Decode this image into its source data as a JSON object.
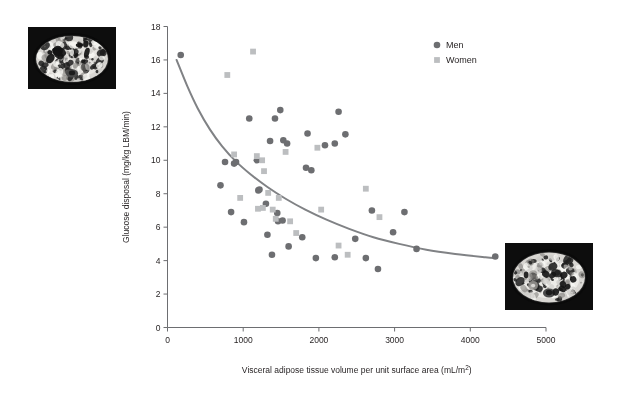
{
  "figure": {
    "background_color": "#ffffff",
    "width": 642,
    "height": 394
  },
  "images": [
    {
      "name": "mri-top-left",
      "caption": "",
      "description_icon": "abdominal-mri-scan"
    },
    {
      "name": "mri-bottom-right",
      "caption": "",
      "description_icon": "abdominal-mri-scan"
    }
  ],
  "chart_data": {
    "type": "scatter",
    "title": "",
    "xlabel": "Visceral adipose tissue volume per unit surface area (mL/m²)",
    "ylabel": "Glucose disposal (mg/kg LBM/min)",
    "xlim": [
      0,
      5000
    ],
    "ylim": [
      0,
      18
    ],
    "xticks": [
      0,
      1000,
      2000,
      3000,
      4000,
      5000
    ],
    "yticks": [
      0,
      2,
      4,
      6,
      8,
      10,
      12,
      14,
      16,
      18
    ],
    "xtick_labels": [
      "0",
      "1000",
      "2000",
      "3000",
      "4000",
      "5000"
    ],
    "ytick_labels": [
      "0",
      "2",
      "4",
      "6",
      "8",
      "10",
      "12",
      "14",
      "16",
      "18"
    ],
    "grid": false,
    "legend_position": "top-right",
    "series": [
      {
        "name": "Men",
        "marker": "circle",
        "color": "#6d6e71",
        "points": [
          [
            175,
            16.3
          ],
          [
            760,
            9.9
          ],
          [
            700,
            8.5
          ],
          [
            880,
            9.8
          ],
          [
            905,
            9.9
          ],
          [
            840,
            6.9
          ],
          [
            1010,
            6.3
          ],
          [
            1080,
            12.5
          ],
          [
            1180,
            10.0
          ],
          [
            1200,
            8.2
          ],
          [
            1215,
            8.25
          ],
          [
            1355,
            11.15
          ],
          [
            1300,
            7.4
          ],
          [
            1320,
            5.55
          ],
          [
            1420,
            12.5
          ],
          [
            1490,
            13.0
          ],
          [
            1530,
            11.2
          ],
          [
            1580,
            11.0
          ],
          [
            1450,
            6.85
          ],
          [
            1460,
            6.35
          ],
          [
            1520,
            6.4
          ],
          [
            1380,
            4.35
          ],
          [
            1600,
            4.85
          ],
          [
            1780,
            5.4
          ],
          [
            1850,
            11.6
          ],
          [
            1830,
            9.55
          ],
          [
            1900,
            9.4
          ],
          [
            2080,
            10.9
          ],
          [
            2210,
            11.0
          ],
          [
            2260,
            12.9
          ],
          [
            2350,
            11.55
          ],
          [
            1960,
            4.15
          ],
          [
            2210,
            4.2
          ],
          [
            2480,
            5.3
          ],
          [
            2620,
            4.15
          ],
          [
            2700,
            7.0
          ],
          [
            2780,
            3.5
          ],
          [
            2980,
            5.7
          ],
          [
            3130,
            6.9
          ],
          [
            3290,
            4.7
          ],
          [
            4330,
            4.25
          ]
        ]
      },
      {
        "name": "Women",
        "marker": "square",
        "color": "#bcbec0",
        "points": [
          [
            790,
            15.1
          ],
          [
            880,
            10.35
          ],
          [
            960,
            7.75
          ],
          [
            1130,
            16.5
          ],
          [
            1180,
            10.25
          ],
          [
            1250,
            10.0
          ],
          [
            1275,
            9.35
          ],
          [
            1195,
            7.1
          ],
          [
            1260,
            7.15
          ],
          [
            1330,
            8.05
          ],
          [
            1390,
            7.05
          ],
          [
            1430,
            6.5
          ],
          [
            1470,
            7.75
          ],
          [
            1560,
            10.5
          ],
          [
            1620,
            6.35
          ],
          [
            1700,
            5.65
          ],
          [
            1980,
            10.75
          ],
          [
            2030,
            7.05
          ],
          [
            2260,
            4.9
          ],
          [
            2380,
            4.35
          ],
          [
            2620,
            8.3
          ],
          [
            2800,
            6.6
          ]
        ]
      }
    ],
    "trend_line": {
      "name": "fitted-curve",
      "color": "#808285",
      "width": 2.0,
      "points": [
        [
          120,
          16.0
        ],
        [
          260,
          14.45
        ],
        [
          400,
          13.1
        ],
        [
          560,
          11.85
        ],
        [
          720,
          10.85
        ],
        [
          900,
          9.95
        ],
        [
          1100,
          9.15
        ],
        [
          1320,
          8.4
        ],
        [
          1560,
          7.7
        ],
        [
          1820,
          7.05
        ],
        [
          2100,
          6.45
        ],
        [
          2400,
          5.9
        ],
        [
          2720,
          5.4
        ],
        [
          3060,
          5.0
        ],
        [
          3420,
          4.65
        ],
        [
          3800,
          4.4
        ],
        [
          4200,
          4.2
        ],
        [
          4330,
          4.15
        ]
      ]
    },
    "legend": [
      {
        "label": "Men",
        "marker": "circle",
        "color": "#6d6e71"
      },
      {
        "label": "Women",
        "marker": "square",
        "color": "#bcbec0"
      }
    ]
  },
  "axis_style": {
    "line_color": "#6d6e71",
    "tick_length": 4
  }
}
